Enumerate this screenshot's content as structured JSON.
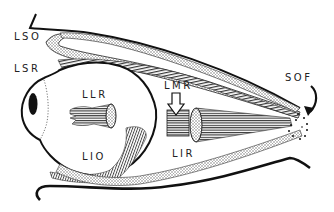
{
  "diagram": {
    "type": "anatomical-illustration",
    "colors": {
      "ink": "#111111",
      "background": "#ffffff",
      "stipple": "#9a9a9a",
      "hatch": "#555555"
    },
    "labels": [
      {
        "id": "LSO",
        "text": "LSO",
        "x": 14,
        "y": 37
      },
      {
        "id": "LSR",
        "text": "LSR",
        "x": 14,
        "y": 69
      },
      {
        "id": "LLR",
        "text": "LLR",
        "x": 82,
        "y": 94
      },
      {
        "id": "LMR",
        "text": "LMR",
        "x": 164,
        "y": 86
      },
      {
        "id": "SOF",
        "text": "SOF",
        "x": 285,
        "y": 77
      },
      {
        "id": "LIO",
        "text": "LIO",
        "x": 82,
        "y": 156
      },
      {
        "id": "LIR",
        "text": "LIR",
        "x": 172,
        "y": 153
      }
    ]
  }
}
